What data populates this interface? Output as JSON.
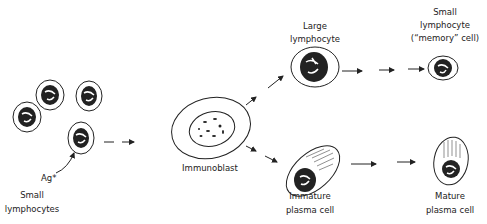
{
  "diagram": {
    "labels": {
      "small_lymphocytes_1": "Small",
      "small_lymphocytes_2": "lymphocytes",
      "antigen": "Ag*",
      "immunoblast": "Immunoblast",
      "large_lymphocyte_1": "Large",
      "large_lymphocyte_2": "lymphocyte",
      "memory_1": "Small",
      "memory_2": "lymphocyte",
      "memory_3": "(“memory” cell)",
      "immature_1": "Immature",
      "immature_2": "plasma cell",
      "mature_1": "Mature",
      "mature_2": "plasma cell"
    },
    "stroke_color": "#222222",
    "background": "#ffffff"
  }
}
